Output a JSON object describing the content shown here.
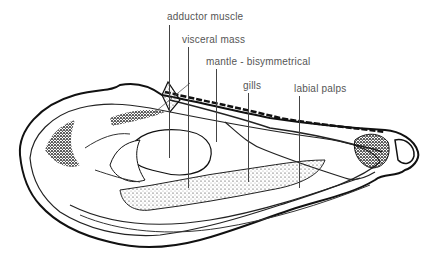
{
  "diagram": {
    "labels": [
      {
        "text": "adductor muscle",
        "x": 168,
        "y": 12,
        "line_x": 169,
        "line_top": 25,
        "line_bottom": 158
      },
      {
        "text": "visceral mass",
        "x": 182,
        "y": 35,
        "line_x": 188,
        "line_top": 47,
        "line_bottom": 188
      },
      {
        "text": "mantle - bisymmetrical",
        "x": 206,
        "y": 57,
        "line_x": 216,
        "line_top": 69,
        "line_bottom": 142
      },
      {
        "text": "gills",
        "x": 243,
        "y": 81,
        "line_x": 248,
        "line_top": 93,
        "line_bottom": 182
      },
      {
        "text": "labial palps",
        "x": 294,
        "y": 84,
        "line_x": 299,
        "line_top": 96,
        "line_bottom": 188
      }
    ],
    "colors": {
      "ink": "#111111",
      "label": "#555555",
      "background": "#ffffff"
    }
  }
}
